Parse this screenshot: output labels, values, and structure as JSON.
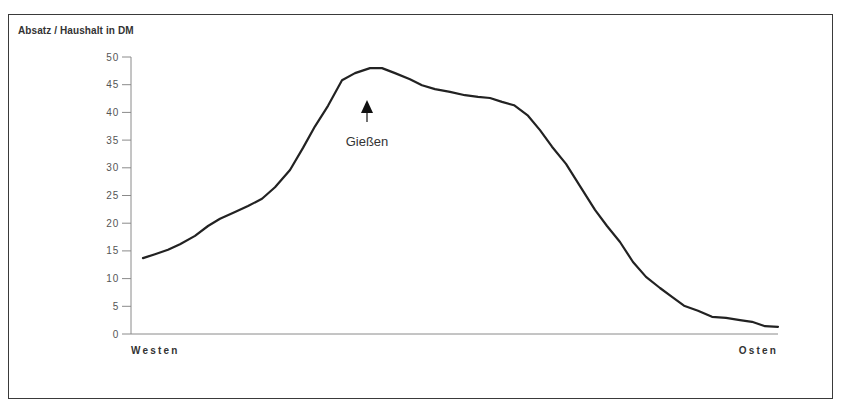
{
  "chart_data": {
    "type": "line",
    "title": "Absatz / Haushalt in DM",
    "xlabel": "",
    "ylabel": "Absatz / Haushalt in DM",
    "x_start_label": "Westen",
    "x_end_label": "Osten",
    "ylim": [
      0,
      50
    ],
    "yticks": [
      0,
      5,
      10,
      15,
      20,
      25,
      30,
      35,
      40,
      45,
      50
    ],
    "grid": false,
    "legend": "none",
    "annotation": {
      "text": "Gießen",
      "marker": "up-arrow",
      "x_index": 17
    },
    "series": [
      {
        "name": "Absatz / Haushalt",
        "x": [
          0,
          1,
          2,
          3,
          4,
          5,
          6,
          7,
          8,
          9,
          10,
          11,
          12,
          13,
          14,
          15,
          16,
          17,
          18,
          19,
          20,
          21,
          22,
          23,
          24,
          25,
          26,
          27,
          28,
          29,
          30,
          31,
          32,
          33,
          34,
          35,
          36,
          37,
          38,
          39,
          40,
          41,
          42,
          43,
          44,
          45,
          46,
          47,
          48
        ],
        "values": [
          13.7,
          14.4,
          15.2,
          16.2,
          17.7,
          19.5,
          20.8,
          22.0,
          23.1,
          24.4,
          26.5,
          29.6,
          33.6,
          37.5,
          41.2,
          45.8,
          47.1,
          48.0,
          48.0,
          47.1,
          46.0,
          44.9,
          44.2,
          43.7,
          43.1,
          42.8,
          42.6,
          41.9,
          41.3,
          39.4,
          36.8,
          33.8,
          30.7,
          26.7,
          22.4,
          19.5,
          16.6,
          13.0,
          10.3,
          8.3,
          6.7,
          5.1,
          4.2,
          3.1,
          2.9,
          2.5,
          2.2,
          1.4,
          1.3
        ]
      }
    ]
  },
  "px": {
    "xs": [
      143,
      155,
      168,
      180,
      195,
      208,
      220,
      235,
      248,
      262,
      275,
      290,
      303,
      315,
      328,
      342,
      355,
      370,
      382,
      395,
      410,
      422,
      435,
      450,
      465,
      478,
      490,
      502,
      514,
      528,
      540,
      552,
      566,
      580,
      595,
      607,
      620,
      633,
      646,
      660,
      672,
      684,
      698,
      712,
      726,
      740,
      752,
      765,
      778
    ]
  }
}
